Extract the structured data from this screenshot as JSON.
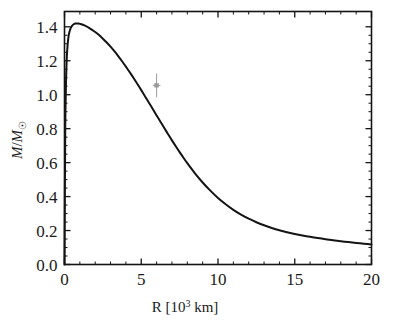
{
  "figure": {
    "name": "white-dwarf-mass-radius-relation",
    "background_color": "#ffffff",
    "frame_color": "#141414",
    "curve_color": "#141414",
    "marker_color": "#9a9a9a"
  },
  "chart_data": {
    "type": "line",
    "title": "",
    "subtitle": "",
    "xlabel": "R [10^3 km]",
    "xlabel_parts": {
      "symbol": "R",
      "open_bracket": "[",
      "base": "10",
      "exponent": "3",
      "unit": "km",
      "close_bracket": "]"
    },
    "ylabel": "M/M☉",
    "ylabel_parts": {
      "numerator": "M",
      "slash": "/",
      "denominator": "M",
      "subscript": "☉"
    },
    "xlim": [
      0,
      20
    ],
    "ylim": [
      0.0,
      1.49
    ],
    "xticks": [
      0,
      5,
      10,
      15,
      20
    ],
    "xtick_labels": [
      "0",
      "5",
      "10",
      "15",
      "20"
    ],
    "x_minor_tick_step": 1,
    "yticks": [
      0.0,
      0.2,
      0.4,
      0.6,
      0.8,
      1.0,
      1.2,
      1.4
    ],
    "ytick_labels": [
      "0.0",
      "0.2",
      "0.4",
      "0.6",
      "0.8",
      "1.0",
      "1.2",
      "1.4"
    ],
    "y_minor_tick_step": 0.05,
    "grid": false,
    "legend": null,
    "tick_direction": "in",
    "frame": "full-box",
    "series": [
      {
        "name": "mass-radius-curve",
        "style": "solid",
        "width": 2.0,
        "color": "#141414",
        "x": [
          0.0,
          0.05,
          0.1,
          0.15,
          0.2,
          0.25,
          0.3,
          0.4,
          0.5,
          0.6,
          0.7,
          0.8,
          0.9,
          1.0,
          1.2,
          1.4,
          1.6,
          1.8,
          2.0,
          2.25,
          2.5,
          2.75,
          3.0,
          3.25,
          3.5,
          3.75,
          4.0,
          4.25,
          4.5,
          4.75,
          5.0,
          5.25,
          5.5,
          5.75,
          6.0,
          6.25,
          6.5,
          6.75,
          7.0,
          7.25,
          7.5,
          7.75,
          8.0,
          8.5,
          9.0,
          9.5,
          10.0,
          10.5,
          11.0,
          11.5,
          12.0,
          12.5,
          13.0,
          13.5,
          14.0,
          14.5,
          15.0,
          15.5,
          16.0,
          16.5,
          17.0,
          17.5,
          18.0,
          18.5,
          19.0,
          19.5,
          20.0
        ],
        "y": [
          0.0,
          0.82,
          1.08,
          1.22,
          1.29,
          1.335,
          1.362,
          1.392,
          1.407,
          1.415,
          1.419,
          1.42,
          1.4195,
          1.418,
          1.412,
          1.404,
          1.394,
          1.382,
          1.369,
          1.351,
          1.33,
          1.307,
          1.283,
          1.256,
          1.227,
          1.197,
          1.165,
          1.132,
          1.098,
          1.063,
          1.027,
          0.99,
          0.953,
          0.916,
          0.878,
          0.841,
          0.804,
          0.767,
          0.731,
          0.696,
          0.662,
          0.629,
          0.597,
          0.537,
          0.483,
          0.435,
          0.392,
          0.355,
          0.322,
          0.294,
          0.27,
          0.249,
          0.231,
          0.215,
          0.202,
          0.19,
          0.18,
          0.171,
          0.163,
          0.156,
          0.149,
          0.143,
          0.137,
          0.132,
          0.127,
          0.122,
          0.118
        ]
      }
    ],
    "points": [
      {
        "name": "observed-white-dwarf",
        "x": 6.0,
        "y": 1.055,
        "xerr": 0.25,
        "yerr": 0.07,
        "marker": "square",
        "color": "#9a9a9a"
      }
    ],
    "annotations": []
  }
}
